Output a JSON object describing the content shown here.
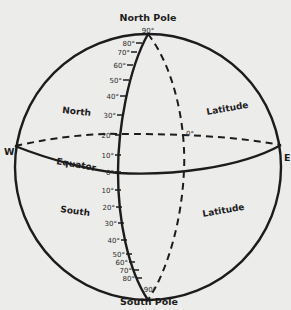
{
  "diagram": {
    "title_top": "North Pole",
    "title_bottom": "South Pole",
    "west_label": "W",
    "east_label": "E",
    "equator_label": "Equator",
    "regions": {
      "north": "North",
      "south": "South",
      "latitude_upper": "Latitude",
      "latitude_lower": "Latitude"
    },
    "north_ticks": [
      "90°",
      "80°",
      "70°",
      "60°",
      "50°",
      "40°",
      "30°",
      "20°",
      "10°"
    ],
    "equator_tick": "0°",
    "back_zero_tick": "0°",
    "south_ticks": [
      "10°",
      "20°",
      "30°",
      "40°",
      "50°",
      "60°",
      "70°",
      "80°",
      "90°"
    ],
    "colors": {
      "background": "#ececea",
      "ink": "#1c1c1c"
    }
  }
}
